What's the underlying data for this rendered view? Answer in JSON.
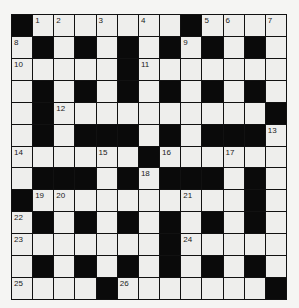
{
  "puzzle": {
    "type": "crossword",
    "size": {
      "rows": 13,
      "cols": 13
    },
    "colors": {
      "black": "#0a0a0a",
      "white": "#eeeeec",
      "background": "#f5f5f3",
      "lines": "#111111"
    },
    "grid": [
      [
        "#",
        "1",
        "2",
        ".",
        "3",
        ".",
        "4",
        ".",
        "#",
        "5",
        "6",
        ".",
        "7"
      ],
      [
        "8",
        "#",
        ".",
        "#",
        ".",
        "#",
        ".",
        "#",
        "9",
        "#",
        ".",
        "#",
        "."
      ],
      [
        "10",
        ".",
        ".",
        ".",
        ".",
        "#",
        "11",
        ".",
        ".",
        ".",
        ".",
        ".",
        "."
      ],
      [
        ".",
        "#",
        ".",
        "#",
        ".",
        "#",
        ".",
        "#",
        ".",
        "#",
        ".",
        "#",
        "."
      ],
      [
        ".",
        "#",
        "12",
        ".",
        ".",
        ".",
        ".",
        ".",
        ".",
        ".",
        ".",
        ".",
        "#"
      ],
      [
        ".",
        "#",
        ".",
        "#",
        "#",
        "#",
        ".",
        "#",
        ".",
        "#",
        "#",
        "#",
        "13"
      ],
      [
        "14",
        ".",
        ".",
        ".",
        "15",
        ".",
        "#",
        "16",
        ".",
        ".",
        "17",
        ".",
        "."
      ],
      [
        ".",
        "#",
        "#",
        "#",
        ".",
        "#",
        "18",
        "#",
        "#",
        "#",
        ".",
        "#",
        "."
      ],
      [
        "#",
        "19",
        "20",
        ".",
        ".",
        ".",
        ".",
        ".",
        "21",
        ".",
        ".",
        "#",
        "."
      ],
      [
        "22",
        "#",
        ".",
        "#",
        ".",
        "#",
        ".",
        "#",
        ".",
        "#",
        ".",
        "#",
        "."
      ],
      [
        "23",
        ".",
        ".",
        ".",
        ".",
        ".",
        ".",
        "#",
        "24",
        ".",
        ".",
        ".",
        "."
      ],
      [
        ".",
        "#",
        ".",
        "#",
        ".",
        "#",
        ".",
        "#",
        ".",
        "#",
        ".",
        "#",
        "."
      ],
      [
        "25",
        ".",
        ".",
        ".",
        "#",
        "26",
        ".",
        ".",
        ".",
        ".",
        ".",
        ".",
        "#"
      ]
    ],
    "clue_numbers": [
      1,
      2,
      3,
      4,
      5,
      6,
      7,
      8,
      9,
      10,
      11,
      12,
      13,
      14,
      15,
      16,
      17,
      18,
      19,
      20,
      21,
      22,
      23,
      24,
      25,
      26
    ]
  }
}
